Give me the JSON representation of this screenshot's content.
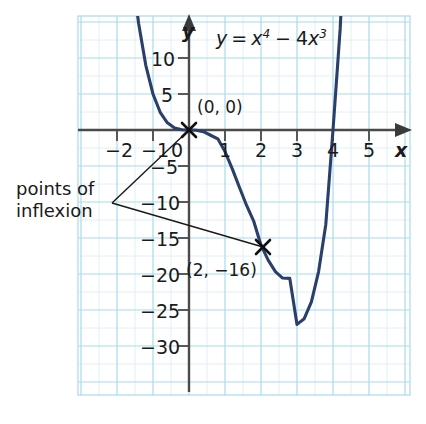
{
  "chart_data": {
    "type": "line",
    "title": "",
    "equation_label": "y = x⁴ − 4x³",
    "equation_parts": {
      "lhs": "y",
      "equals": "=",
      "term1_base": "x",
      "term1_exp": "4",
      "minus": "−",
      "term2_coef": "4",
      "term2_base": "x",
      "term2_exp": "3"
    },
    "xlabel": "x",
    "ylabel": "y",
    "xlim": [
      -3,
      5.6
    ],
    "ylim": [
      -33,
      13
    ],
    "x_ticks": [
      -2,
      -1,
      0,
      1,
      2,
      3,
      4,
      5
    ],
    "x_tick_labels": [
      "−2",
      "−1",
      "0",
      "1",
      "2",
      "3",
      "4",
      "5"
    ],
    "y_ticks": [
      10,
      5,
      -5,
      -10,
      -15,
      -20,
      -25,
      -30
    ],
    "y_tick_labels": [
      "10",
      "5",
      "−5",
      "−10",
      "−15",
      "−20",
      "−25",
      "−30"
    ],
    "grid": true,
    "grid_major_step_x": 1,
    "grid_major_step_y": 5,
    "legend": "none",
    "curve_color": "#2b3f6b",
    "grid_color": "#a9dbec",
    "grid_minor_color": "#d7eef6",
    "axis_color": "#4a4a4a",
    "annotation_color": "#1a1a1a",
    "series": [
      {
        "name": "y = x^4 - 4x^3",
        "x": [
          -1.55,
          -1.4,
          -1.2,
          -1.0,
          -0.8,
          -0.6,
          -0.4,
          -0.2,
          0.0,
          0.2,
          0.4,
          0.6,
          0.8,
          1.0,
          1.2,
          1.4,
          1.6,
          1.8,
          2.0,
          2.2,
          2.4,
          2.6,
          2.8,
          3.0,
          3.2,
          3.4,
          3.6,
          3.8,
          4.0,
          4.2,
          4.35
        ],
        "y": [
          20.66,
          14.82,
          8.99,
          5.0,
          2.46,
          1.0,
          0.29,
          0.03,
          0.0,
          -0.03,
          -0.23,
          -0.73,
          -1.23,
          -3.0,
          -5.37,
          -7.96,
          -10.48,
          -12.7,
          -16.0,
          -18.08,
          -19.66,
          -20.56,
          -20.61,
          -27.0,
          -26.21,
          -23.88,
          -19.66,
          -13.12,
          0.0,
          14.11,
          30.0
        ]
      }
    ],
    "marked_points": [
      {
        "label": "(0, 0)",
        "x": 0,
        "y": 0,
        "marker": "x"
      },
      {
        "label": "(2, −16)",
        "x": 2,
        "y": -16,
        "marker": "x"
      }
    ],
    "annotations": [
      {
        "text_line1": "points of",
        "text_line2": "inflexion",
        "points_to": [
          "(0, 0)",
          "(2, −16)"
        ]
      }
    ]
  },
  "labels": {
    "points_of_inflexion_line1": "points of",
    "points_of_inflexion_line2": "inflexion",
    "origin_point": "(0, 0)",
    "inflexion_point": "(2, −16)",
    "x_axis_name": "x",
    "y_axis_name": "y"
  }
}
